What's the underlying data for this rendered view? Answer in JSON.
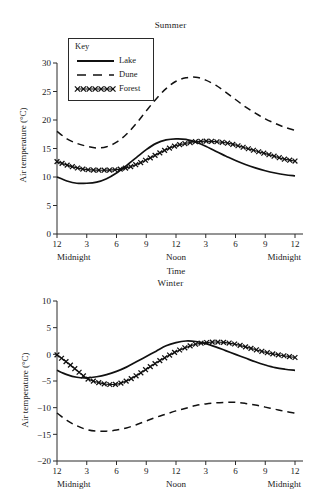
{
  "figure": {
    "ylabel": "Air temperature (°C)",
    "xlabel": "Time",
    "x_tick_labels": [
      "12",
      "3",
      "6",
      "9",
      "12",
      "3",
      "6",
      "9",
      "12"
    ],
    "x_daypart_labels": [
      "Midnight",
      "Noon",
      "Midnight"
    ],
    "legend": {
      "title": "Key",
      "items": [
        {
          "label": "Lake",
          "style": "solid-line"
        },
        {
          "label": "Dune",
          "style": "dashed-line"
        },
        {
          "label": "Forest",
          "style": "x-marker-line"
        }
      ]
    }
  },
  "chart_data": [
    {
      "type": "line",
      "title": "Summer",
      "xlabel": "Time",
      "ylabel": "Air temperature (°C)",
      "xlim": [
        0,
        24
      ],
      "ylim": [
        0,
        30
      ],
      "ytick_labels": [
        "0",
        "5",
        "10",
        "15",
        "20",
        "25",
        "30"
      ],
      "yticks": [
        0,
        5,
        10,
        15,
        20,
        25,
        30
      ],
      "xticks": [
        0,
        3,
        6,
        9,
        12,
        15,
        18,
        21,
        24
      ],
      "xtick_labels": [
        "12",
        "3",
        "6",
        "9",
        "12",
        "3",
        "6",
        "9",
        "12"
      ],
      "grid": false,
      "legend_position": "upper-left-inset",
      "x": [
        0,
        1,
        2,
        3,
        4,
        5,
        6,
        7,
        8,
        9,
        10,
        11,
        12,
        13,
        14,
        15,
        16,
        17,
        18,
        19,
        20,
        21,
        22,
        23,
        24
      ],
      "series": [
        {
          "name": "Lake",
          "values": [
            10.0,
            9.3,
            8.9,
            8.9,
            9.1,
            9.7,
            10.7,
            12.0,
            13.4,
            14.8,
            15.9,
            16.5,
            16.7,
            16.6,
            16.1,
            15.4,
            14.5,
            13.7,
            12.9,
            12.2,
            11.6,
            11.1,
            10.7,
            10.4,
            10.2
          ]
        },
        {
          "name": "Dune",
          "values": [
            18.0,
            16.7,
            15.9,
            15.4,
            15.1,
            15.3,
            16.1,
            17.5,
            19.4,
            21.6,
            23.7,
            25.5,
            26.8,
            27.4,
            27.5,
            27.0,
            26.1,
            24.9,
            23.6,
            22.3,
            21.2,
            20.2,
            19.4,
            18.7,
            18.2
          ]
        },
        {
          "name": "Forest",
          "values": [
            12.7,
            12.1,
            11.6,
            11.3,
            11.2,
            11.2,
            11.3,
            11.6,
            12.2,
            13.0,
            13.9,
            14.8,
            15.5,
            15.9,
            16.2,
            16.3,
            16.2,
            16.0,
            15.6,
            15.1,
            14.6,
            14.1,
            13.6,
            13.1,
            12.8
          ]
        }
      ]
    },
    {
      "type": "line",
      "title": "Winter",
      "xlabel": "Time",
      "ylabel": "Air temperature (°C)",
      "xlim": [
        0,
        24
      ],
      "ylim": [
        -20,
        10
      ],
      "ytick_labels": [
        "−20",
        "−15",
        "−10",
        "−5",
        "0",
        "5",
        "10"
      ],
      "yticks": [
        -20,
        -15,
        -10,
        -5,
        0,
        5,
        10
      ],
      "xticks": [
        0,
        3,
        6,
        9,
        12,
        15,
        18,
        21,
        24
      ],
      "xtick_labels": [
        "12",
        "3",
        "6",
        "9",
        "12",
        "3",
        "6",
        "9",
        "12"
      ],
      "grid": false,
      "legend_position": "none",
      "x": [
        0,
        1,
        2,
        3,
        4,
        5,
        6,
        7,
        8,
        9,
        10,
        11,
        12,
        13,
        14,
        15,
        16,
        17,
        18,
        19,
        20,
        21,
        22,
        23,
        24
      ],
      "series": [
        {
          "name": "Lake",
          "values": [
            -3.0,
            -3.8,
            -4.3,
            -4.4,
            -4.2,
            -3.8,
            -3.2,
            -2.4,
            -1.4,
            -0.4,
            0.6,
            1.6,
            2.2,
            2.5,
            2.4,
            2.0,
            1.4,
            0.7,
            0.0,
            -0.7,
            -1.4,
            -2.0,
            -2.5,
            -2.8,
            -3.0
          ]
        },
        {
          "name": "Dune",
          "values": [
            -11.0,
            -12.4,
            -13.4,
            -14.1,
            -14.4,
            -14.4,
            -14.2,
            -13.8,
            -13.2,
            -12.5,
            -11.8,
            -11.2,
            -10.6,
            -10.1,
            -9.6,
            -9.3,
            -9.1,
            -9.0,
            -9.0,
            -9.2,
            -9.5,
            -9.9,
            -10.3,
            -10.7,
            -11.0
          ]
        },
        {
          "name": "Forest",
          "values": [
            -0.1,
            -1.5,
            -3.0,
            -4.5,
            -5.2,
            -5.6,
            -5.6,
            -5.0,
            -4.0,
            -2.8,
            -1.6,
            -0.5,
            0.5,
            1.3,
            1.9,
            2.2,
            2.3,
            2.2,
            1.9,
            1.4,
            0.9,
            0.4,
            0.0,
            -0.3,
            -0.6
          ]
        }
      ]
    }
  ]
}
